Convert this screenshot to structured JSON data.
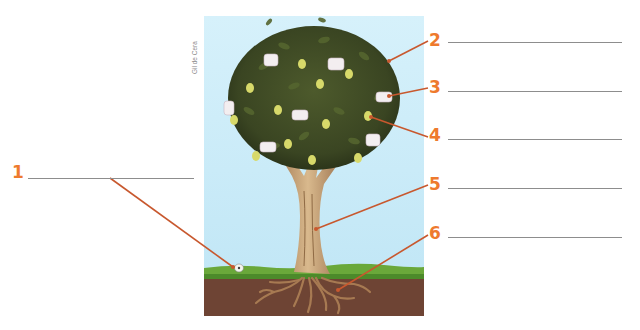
{
  "figure": {
    "credit": "Gil de Cera",
    "accent_color": "#ee7a2e",
    "leader_color": "#c8582e",
    "answer_line_color": "#8d8d8d"
  },
  "labels": [
    {
      "number": "1",
      "answer": "",
      "points_to": "seed"
    },
    {
      "number": "2",
      "answer": "",
      "points_to": "leaves"
    },
    {
      "number": "3",
      "answer": "",
      "points_to": "flower"
    },
    {
      "number": "4",
      "answer": "",
      "points_to": "fruit"
    },
    {
      "number": "5",
      "answer": "",
      "points_to": "trunk"
    },
    {
      "number": "6",
      "answer": "",
      "points_to": "roots"
    }
  ]
}
